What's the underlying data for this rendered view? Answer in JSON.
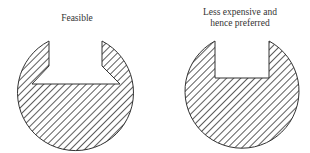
{
  "diagram": {
    "left": {
      "label": "Feasible",
      "description": "Circular cross-section with chamfered (dovetail-flared) slot"
    },
    "right": {
      "label_line1": "Less expensive and",
      "label_line2": "hence preferred",
      "description": "Circular cross-section with straight rectangular slot"
    }
  },
  "colors": {
    "stroke": "#333333",
    "hatch": "#333333",
    "background": "#ffffff"
  }
}
